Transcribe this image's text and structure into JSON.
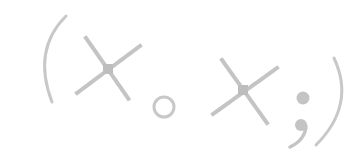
{
  "emoticon": {
    "text": "(×。×;)",
    "description": "kaomoji: dizzy / knocked-out face with sweat drop",
    "parts": {
      "left_paren": "(",
      "left_eye": "×",
      "mouth": "。",
      "right_eye": "×",
      "sweat": ";",
      "right_paren": ")"
    }
  },
  "colors": {
    "background": "#ffffff",
    "stroke": "#c8c8c8",
    "stroke_dark": "#bdbdbd"
  }
}
